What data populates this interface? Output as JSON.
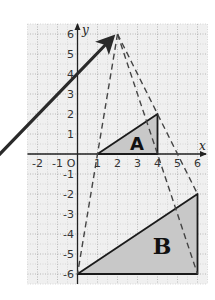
{
  "diagram": {
    "type": "coordinate-grid-enlargement",
    "axes": {
      "x_label": "x",
      "y_label": "y",
      "origin_label": "O",
      "x_ticks": [
        "-2",
        "-1",
        "1",
        "2",
        "3",
        "4",
        "5",
        "6"
      ],
      "y_ticks": [
        "6",
        "5",
        "4",
        "3",
        "2",
        "1",
        "-1",
        "-2",
        "-3",
        "-4",
        "-5",
        "-6"
      ],
      "x_range": [
        -2.5,
        6.5
      ],
      "y_range": [
        -6.5,
        6.5
      ]
    },
    "center_of_enlargement": [
      2,
      6
    ],
    "shapes": [
      {
        "label": "A",
        "vertices": [
          [
            1,
            0
          ],
          [
            4,
            0
          ],
          [
            4,
            2
          ]
        ],
        "fill": "#c8c8c8"
      },
      {
        "label": "B",
        "vertices": [
          [
            0,
            -6
          ],
          [
            6,
            -6
          ],
          [
            6,
            -2
          ]
        ],
        "fill": "#c8c8c8"
      }
    ],
    "rays": [
      {
        "from": [
          2,
          6
        ],
        "to": [
          0,
          -6
        ],
        "style": "dashed"
      },
      {
        "from": [
          2,
          6
        ],
        "to": [
          6,
          -6
        ],
        "style": "dashed"
      },
      {
        "from": [
          2,
          6
        ],
        "to": [
          6,
          -2
        ],
        "style": "dashed"
      }
    ],
    "arrow": {
      "points_to": [
        2,
        6
      ],
      "color": "#2a2a2a"
    },
    "colors": {
      "grid_background": "#f0f0f0",
      "grid_lines": "#a8a8a8",
      "axis": "#222222",
      "shape_outline": "#1a1a1a"
    }
  }
}
